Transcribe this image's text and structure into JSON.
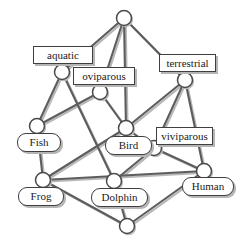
{
  "diagram": {
    "type": "concept-lattice",
    "width": 240,
    "height": 243,
    "colors": {
      "edge": "#5d5d5d",
      "edge_shadow": "#b8b8b8",
      "node_fill": "#ffffff",
      "node_stroke": "#4a4a4a",
      "label_border": "#3f3f3f",
      "label_text": "#1a1a1a",
      "background": "#ffffff"
    },
    "nodes": [
      {
        "id": "top",
        "x": 124,
        "y": 18,
        "r": 7.5
      },
      {
        "id": "aquatic",
        "x": 62,
        "y": 72,
        "r": 7.5
      },
      {
        "id": "oviparous",
        "x": 100,
        "y": 92,
        "r": 7.5
      },
      {
        "id": "terrestrial",
        "x": 185,
        "y": 80,
        "r": 7.5
      },
      {
        "id": "fish",
        "x": 37,
        "y": 126,
        "r": 7.5
      },
      {
        "id": "bird",
        "x": 126,
        "y": 128,
        "r": 7.5
      },
      {
        "id": "viviparous",
        "x": 154,
        "y": 148,
        "r": 7.5
      },
      {
        "id": "frog",
        "x": 43,
        "y": 180,
        "r": 7.5
      },
      {
        "id": "dolphin",
        "x": 114,
        "y": 181,
        "r": 7.5
      },
      {
        "id": "human",
        "x": 204,
        "y": 171,
        "r": 7.5
      },
      {
        "id": "bottom",
        "x": 127,
        "y": 226,
        "r": 7.5
      }
    ],
    "edges": [
      {
        "from": "top",
        "to": "aquatic"
      },
      {
        "from": "top",
        "to": "oviparous"
      },
      {
        "from": "top",
        "to": "terrestrial"
      },
      {
        "from": "top",
        "to": "bird"
      },
      {
        "from": "aquatic",
        "to": "fish"
      },
      {
        "from": "aquatic",
        "to": "dolphin"
      },
      {
        "from": "oviparous",
        "to": "fish"
      },
      {
        "from": "oviparous",
        "to": "bird"
      },
      {
        "from": "terrestrial",
        "to": "bird"
      },
      {
        "from": "terrestrial",
        "to": "viviparous"
      },
      {
        "from": "terrestrial",
        "to": "human"
      },
      {
        "from": "fish",
        "to": "frog"
      },
      {
        "from": "bird",
        "to": "frog"
      },
      {
        "from": "bird",
        "to": "viviparous"
      },
      {
        "from": "viviparous",
        "to": "dolphin"
      },
      {
        "from": "viviparous",
        "to": "human"
      },
      {
        "from": "frog",
        "to": "bottom"
      },
      {
        "from": "frog",
        "to": "human"
      },
      {
        "from": "dolphin",
        "to": "bottom"
      },
      {
        "from": "human",
        "to": "bottom"
      }
    ],
    "labels": [
      {
        "id": "label-aquatic",
        "text": "aquatic",
        "kind": "attribute",
        "x": 33,
        "y": 46,
        "w": 60,
        "h": 18
      },
      {
        "id": "label-oviparous",
        "text": "oviparous",
        "kind": "attribute",
        "x": 73,
        "y": 67,
        "w": 62,
        "h": 18
      },
      {
        "id": "label-terrestrial",
        "text": "terrestrial",
        "kind": "attribute",
        "x": 159,
        "y": 54,
        "w": 57,
        "h": 18
      },
      {
        "id": "label-viviparous",
        "text": "viviparous",
        "kind": "attribute",
        "x": 156,
        "y": 127,
        "w": 57,
        "h": 18
      },
      {
        "id": "label-fish",
        "text": "Fish",
        "kind": "object",
        "x": 17,
        "y": 133,
        "w": 44,
        "h": 19
      },
      {
        "id": "label-bird",
        "text": "Bird",
        "kind": "object",
        "x": 105,
        "y": 136,
        "w": 47,
        "h": 19
      },
      {
        "id": "label-human",
        "text": "Human",
        "kind": "object",
        "x": 182,
        "y": 177,
        "w": 52,
        "h": 19
      },
      {
        "id": "label-frog",
        "text": "Frog",
        "kind": "object",
        "x": 18,
        "y": 187,
        "w": 46,
        "h": 19
      },
      {
        "id": "label-dolphin",
        "text": "Dolphin",
        "kind": "object",
        "x": 91,
        "y": 188,
        "w": 57,
        "h": 19
      }
    ]
  }
}
